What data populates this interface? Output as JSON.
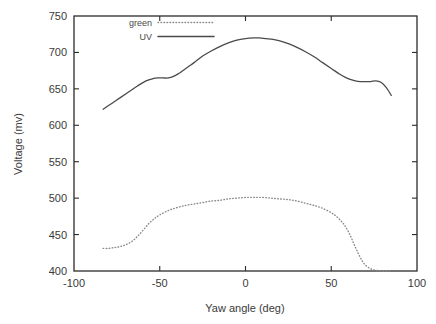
{
  "chart_data": {
    "type": "line",
    "title": "",
    "xlabel": "Yaw angle (deg)",
    "ylabel": "Voltage (mv)",
    "xlim": [
      -100,
      100
    ],
    "ylim": [
      400,
      750
    ],
    "xticks": [
      -100,
      -50,
      0,
      50,
      100
    ],
    "xtick_labels": [
      "-100",
      "-50",
      "0",
      "50",
      "100"
    ],
    "yticks": [
      400,
      450,
      500,
      550,
      600,
      650,
      700,
      750
    ],
    "ytick_labels": [
      "400",
      "450",
      "500",
      "550",
      "600",
      "650",
      "700",
      "750"
    ],
    "grid": false,
    "legend_position": "top-left-inside",
    "series": [
      {
        "name": "green",
        "style": "dotted",
        "color": "#8a8a8a",
        "x": [
          -83,
          -80,
          -77,
          -74,
          -71,
          -68,
          -65,
          -62,
          -59,
          -56,
          -53,
          -50,
          -45,
          -40,
          -35,
          -30,
          -25,
          -20,
          -15,
          -10,
          -5,
          0,
          5,
          10,
          15,
          20,
          25,
          30,
          35,
          40,
          45,
          50,
          53,
          56,
          58,
          60,
          62,
          64,
          66,
          68,
          70,
          73,
          76,
          80,
          84
        ],
        "y": [
          431,
          431,
          432,
          433,
          435,
          438,
          443,
          450,
          458,
          466,
          472,
          477,
          483,
          487,
          490,
          492,
          494,
          496,
          497,
          499,
          500,
          501,
          501,
          501,
          500,
          499,
          498,
          496,
          493,
          490,
          486,
          480,
          475,
          468,
          462,
          454,
          444,
          433,
          423,
          414,
          408,
          403,
          401,
          400,
          400
        ]
      },
      {
        "name": "UV",
        "style": "solid",
        "color": "#4a4a4a",
        "x": [
          -83,
          -78,
          -73,
          -68,
          -63,
          -58,
          -54,
          -51,
          -48,
          -45,
          -42,
          -39,
          -36,
          -33,
          -30,
          -25,
          -20,
          -15,
          -10,
          -5,
          0,
          5,
          8,
          12,
          16,
          20,
          25,
          30,
          35,
          40,
          45,
          50,
          55,
          58,
          61,
          64,
          67,
          70,
          73,
          76,
          79,
          82,
          85
        ],
        "y": [
          622,
          630,
          638,
          646,
          654,
          661,
          664,
          665,
          665,
          665,
          667,
          671,
          676,
          681,
          686,
          695,
          702,
          708,
          713,
          717,
          719,
          720,
          720,
          719,
          718,
          716,
          712,
          707,
          701,
          694,
          686,
          678,
          670,
          666,
          663,
          661,
          660,
          660,
          660,
          661,
          659,
          652,
          641
        ]
      }
    ]
  },
  "legend": {
    "entries": [
      {
        "label": "green"
      },
      {
        "label": "UV"
      }
    ]
  },
  "axes": {
    "x_title": "Yaw angle (deg)",
    "y_title": "Voltage (mv)"
  }
}
